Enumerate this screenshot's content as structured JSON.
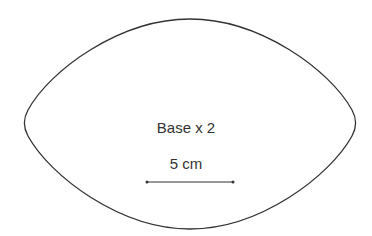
{
  "diagram": {
    "shape": "lens",
    "label": "Base x 2",
    "scale_bar": {
      "label": "5 cm",
      "length_px": 86
    },
    "colors": {
      "stroke": "#333333",
      "background": "#ffffff",
      "text": "#333333"
    }
  }
}
